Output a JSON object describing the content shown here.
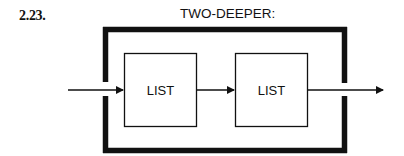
{
  "figure": {
    "number": "2.23.",
    "title": "TWO-DEEPER:"
  },
  "diagram": {
    "outer_frame": {
      "label": "TWO-DEEPER"
    },
    "boxes": [
      {
        "id": "list-1",
        "label": "LIST"
      },
      {
        "id": "list-2",
        "label": "LIST"
      }
    ],
    "arrows": [
      {
        "from": "input",
        "to": "list-1"
      },
      {
        "from": "list-1",
        "to": "list-2"
      },
      {
        "from": "list-2",
        "to": "output"
      }
    ],
    "colors": {
      "stroke": "#111111",
      "background": "#ffffff"
    }
  }
}
